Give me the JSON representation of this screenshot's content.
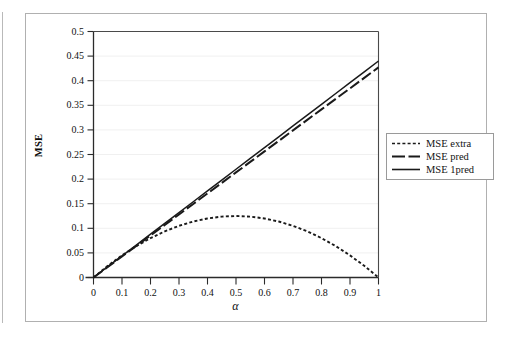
{
  "figure": {
    "background": "#ffffff",
    "frame_color": "#b0b0b0"
  },
  "axis": {
    "x_title": "α",
    "y_title": "MSE",
    "x_ticks": [
      "0",
      "0.1",
      "0.2",
      "0.3",
      "0.4",
      "0.5",
      "0.6",
      "0.7",
      "0.8",
      "0.9",
      "1"
    ],
    "y_ticks": [
      "0",
      "0.05",
      "0.1",
      "0.15",
      "0.2",
      "0.25",
      "0.3",
      "0.35",
      "0.4",
      "0.45",
      "0.5"
    ]
  },
  "legend": {
    "items": [
      {
        "label": "MSE extra",
        "style": "dotted",
        "color": "#1a1a1a"
      },
      {
        "label": "MSE pred",
        "style": "dashed",
        "color": "#1a1a1a"
      },
      {
        "label": "MSE 1pred",
        "style": "solid",
        "color": "#1a1a1a"
      }
    ]
  },
  "chart_data": {
    "type": "line",
    "title": "",
    "xlabel": "α",
    "ylabel": "MSE",
    "xlim": [
      0,
      1
    ],
    "ylim": [
      0,
      0.5
    ],
    "grid": true,
    "grid_axis": "y",
    "grid_color": "#f0f0f0",
    "legend_position": "right-outside",
    "x": [
      0,
      0.05,
      0.1,
      0.15,
      0.2,
      0.25,
      0.3,
      0.35,
      0.4,
      0.45,
      0.5,
      0.55,
      0.6,
      0.65,
      0.7,
      0.75,
      0.8,
      0.85,
      0.9,
      0.95,
      1
    ],
    "series": [
      {
        "name": "MSE extra",
        "style": "dotted",
        "color": "#1a1a1a",
        "values": [
          0,
          0.0238,
          0.045,
          0.0638,
          0.08,
          0.0938,
          0.105,
          0.1138,
          0.12,
          0.1238,
          0.125,
          0.1238,
          0.12,
          0.1138,
          0.105,
          0.0938,
          0.08,
          0.0638,
          0.045,
          0.0238,
          0
        ]
      },
      {
        "name": "MSE pred",
        "style": "dashed",
        "color": "#1a1a1a",
        "values": [
          0,
          0.0214,
          0.0427,
          0.0641,
          0.0854,
          0.1068,
          0.1281,
          0.1495,
          0.1709,
          0.1922,
          0.2136,
          0.2349,
          0.2563,
          0.2776,
          0.299,
          0.3204,
          0.3417,
          0.3631,
          0.3844,
          0.4058,
          0.427
        ]
      },
      {
        "name": "MSE 1pred",
        "style": "solid",
        "color": "#1a1a1a",
        "values": [
          0,
          0.022,
          0.044,
          0.066,
          0.088,
          0.11,
          0.132,
          0.154,
          0.176,
          0.198,
          0.22,
          0.242,
          0.264,
          0.286,
          0.308,
          0.33,
          0.352,
          0.374,
          0.396,
          0.418,
          0.44
        ]
      }
    ]
  }
}
